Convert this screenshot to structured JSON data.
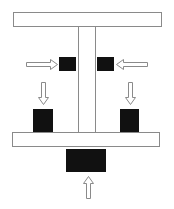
{
  "diagram": {
    "colors": {
      "background": "#ffffff",
      "outline": "#8a8a8a",
      "block": "#111111",
      "arrow_fill": "#ffffff",
      "arrow_stroke": "#8a8a8a"
    },
    "shapes": {
      "top_beam": {
        "x": 13,
        "y": 12,
        "w": 148,
        "h": 14
      },
      "column": {
        "x": 78,
        "y": 26,
        "w": 17,
        "h": 106
      },
      "bottom_plate": {
        "x": 12,
        "y": 132,
        "w": 147,
        "h": 14
      },
      "left_upper_block": {
        "x": 59,
        "y": 57,
        "w": 17,
        "h": 14
      },
      "right_upper_block": {
        "x": 97,
        "y": 57,
        "w": 17,
        "h": 14
      },
      "left_lower_block": {
        "x": 33,
        "y": 109,
        "w": 20,
        "h": 23
      },
      "right_lower_block": {
        "x": 120,
        "y": 109,
        "w": 19,
        "h": 23
      },
      "bottom_center_block": {
        "x": 66,
        "y": 149,
        "w": 40,
        "h": 23
      }
    },
    "arrows": [
      {
        "name": "left-horizontal-arrow",
        "direction": "right"
      },
      {
        "name": "right-horizontal-arrow",
        "direction": "left"
      },
      {
        "name": "left-down-arrow",
        "direction": "down"
      },
      {
        "name": "right-down-arrow",
        "direction": "down"
      },
      {
        "name": "bottom-up-arrow",
        "direction": "up"
      }
    ]
  }
}
